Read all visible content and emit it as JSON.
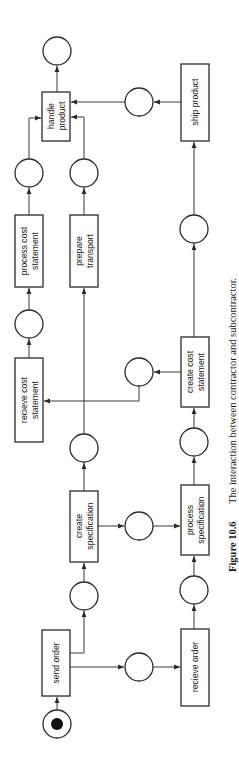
{
  "figure": {
    "caption_number": "Figure 10.6",
    "caption_text": "The interaction between contractor and subcontractor."
  },
  "transitions": {
    "send_order": {
      "line1": "send order",
      "line2": ""
    },
    "create_specification": {
      "line1": "create",
      "line2": "specification"
    },
    "recieve_cost_statement": {
      "line1": "recieve cost",
      "line2": "statement"
    },
    "process_cost_statement": {
      "line1": "process cost",
      "line2": "statement"
    },
    "prepare_transport": {
      "line1": "prepare",
      "line2": "transport"
    },
    "handle_product": {
      "line1": "handle",
      "line2": "product"
    },
    "recieve_order": {
      "line1": "recieve order",
      "line2": ""
    },
    "process_specification": {
      "line1": "process",
      "line2": "specification"
    },
    "create_cost_statement": {
      "line1": "create cost",
      "line2": "statement"
    },
    "ship_product": {
      "line1": "ship product",
      "line2": ""
    }
  },
  "places": {
    "start": {
      "tokens": 1
    },
    "count": 14
  },
  "colors": {
    "stroke": "#2a2a2a",
    "token": "#111111",
    "background": "#ffffff"
  }
}
